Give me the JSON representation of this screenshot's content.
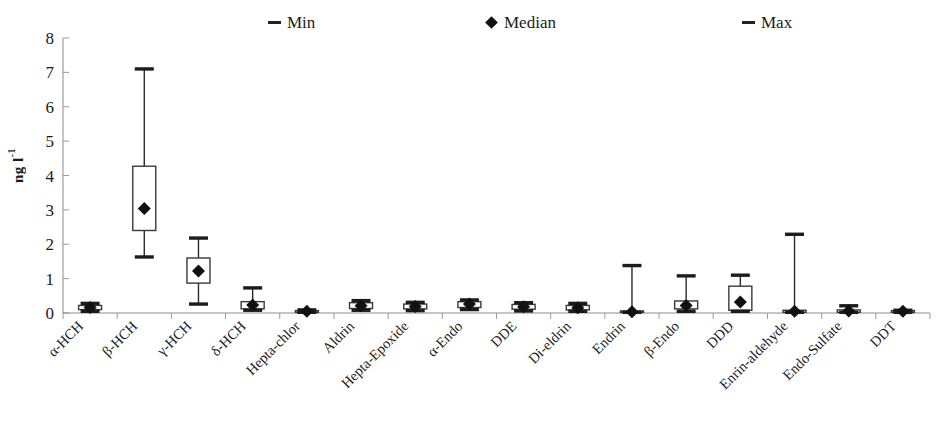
{
  "legend": {
    "min_label": "Min",
    "median_label": "Median",
    "max_label": "Max"
  },
  "axis": {
    "ylabel_main": "ng l",
    "ylabel_sup": "-1"
  },
  "chart_data": {
    "type": "box",
    "title": "",
    "xlabel": "",
    "ylabel": "ng l-1",
    "ylim": [
      0,
      8
    ],
    "yticks": [
      0,
      1,
      2,
      3,
      4,
      5,
      6,
      7,
      8
    ],
    "ytick_labels": [
      "0",
      "1",
      "2",
      "3",
      "4",
      "5",
      "6",
      "7",
      "8"
    ],
    "grid": false,
    "legend_position": "top",
    "categories": [
      "α-HCH",
      "β-HCH",
      "γ-HCH",
      "δ-HCH",
      "Hepta-chlor",
      "Aldrin",
      "Hepta-Epoxide",
      "α-Endo",
      "DDE",
      "Di-eldrin",
      "Endrin",
      "β-Endo",
      "DDD",
      "Enrin-aldehyde",
      "Endo-Sulfate",
      "DDT"
    ],
    "series": [
      {
        "name": "Min",
        "values": [
          0.05,
          1.63,
          0.26,
          0.08,
          0.02,
          0.08,
          0.07,
          0.1,
          0.06,
          0.05,
          0.02,
          0.05,
          0.05,
          0.02,
          0.02,
          0.02
        ]
      },
      {
        "name": "Q1",
        "values": [
          0.1,
          2.4,
          0.87,
          0.12,
          0.02,
          0.13,
          0.12,
          0.16,
          0.11,
          0.09,
          0.02,
          0.12,
          0.08,
          0.02,
          0.02,
          0.02
        ]
      },
      {
        "name": "Median",
        "values": [
          0.16,
          3.04,
          1.22,
          0.23,
          0.05,
          0.21,
          0.19,
          0.26,
          0.18,
          0.15,
          0.04,
          0.22,
          0.32,
          0.05,
          0.06,
          0.05
        ]
      },
      {
        "name": "Q3",
        "values": [
          0.22,
          4.27,
          1.6,
          0.33,
          0.07,
          0.3,
          0.26,
          0.33,
          0.25,
          0.22,
          0.06,
          0.35,
          0.78,
          0.08,
          0.09,
          0.07
        ]
      },
      {
        "name": "Max",
        "values": [
          0.28,
          7.1,
          2.18,
          0.73,
          0.09,
          0.36,
          0.31,
          0.38,
          0.3,
          0.28,
          1.38,
          1.08,
          1.1,
          2.29,
          0.21,
          0.08
        ]
      }
    ]
  }
}
